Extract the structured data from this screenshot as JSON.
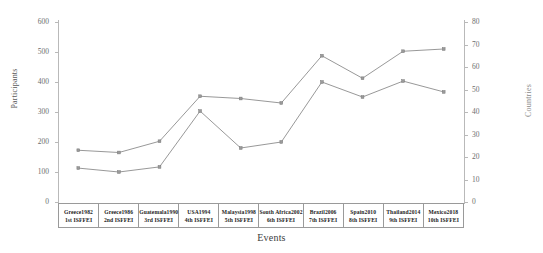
{
  "chart_data": {
    "type": "line",
    "title": "",
    "subtitle": "",
    "xlabel": "Events",
    "ylabel": "Participants",
    "y2label": "Countries",
    "grid": false,
    "legend": "none",
    "categories": [
      "Greece1982\n1st ISFFEI",
      "Greece1986\n2nd ISFFEI",
      "Guatemala1990\n3rd ISFFEI",
      "USA1994\n4th ISFFEI",
      "Malaysia1998\n5th ISFFEI",
      "South Africa2002\n6th ISFFEI",
      "Brazil2006\n7th ISFFEI",
      "Spain2010\n8th ISFFEI",
      "Thailand2014\n9th ISFFEI",
      "Mexico2018\n10th ISFFEI"
    ],
    "category_lines": [
      {
        "line1": "Greece1982",
        "line2": "1st ISFFEI"
      },
      {
        "line1": "Greece1986",
        "line2": "2nd ISFFEI"
      },
      {
        "line1": "Guatemala1990",
        "line2": "3rd ISFFEI"
      },
      {
        "line1": "USA1994",
        "line2": "4th ISFFEI"
      },
      {
        "line1": "Malaysia1998",
        "line2": "5th ISFFEI"
      },
      {
        "line1": "South Africa2002",
        "line2": "6th ISFFEI"
      },
      {
        "line1": "Brazil2006",
        "line2": "7th ISFFEI"
      },
      {
        "line1": "Spain2010",
        "line2": "8th ISFFEI"
      },
      {
        "line1": "Thailand2014",
        "line2": "9th ISFFEI"
      },
      {
        "line1": "Mexico2018",
        "line2": "10th ISFFEI"
      }
    ],
    "ylim": [
      0,
      600
    ],
    "yticks": [
      0,
      100,
      200,
      300,
      400,
      500,
      600
    ],
    "y2lim": [
      0,
      80
    ],
    "y2ticks": [
      0,
      10,
      20,
      30,
      40,
      50,
      60,
      70,
      80
    ],
    "series": [
      {
        "name": "Countries",
        "axis": "right",
        "color": "#8c8c8c",
        "values": [
          23,
          22,
          27,
          47,
          46,
          44,
          65,
          55,
          67,
          68
        ]
      },
      {
        "name": "Participants",
        "axis": "left",
        "color": "#8c8c8c",
        "values": [
          113,
          100,
          117,
          303,
          180,
          200,
          400,
          350,
          403,
          367
        ]
      }
    ]
  }
}
